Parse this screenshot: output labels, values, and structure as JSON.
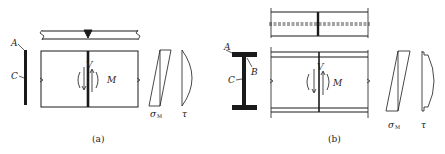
{
  "figure": {
    "panels": [
      {
        "id": "a",
        "caption": "(a)",
        "section_labels": {
          "top": "A",
          "middle": "C"
        },
        "internal_forces": {
          "shear": "V",
          "moment": "M"
        },
        "stress_diagrams": {
          "normal": "σ",
          "normal_sub": "M",
          "shear": "τ"
        },
        "description": "Plate (rectangular section) with butt weld; weld line under shear V and moment M"
      },
      {
        "id": "b",
        "caption": "(b)",
        "section_labels": {
          "top": "A",
          "flange_web": "B",
          "middle": "C"
        },
        "internal_forces": {
          "shear": "V",
          "moment": "M"
        },
        "stress_diagrams": {
          "normal": "σ",
          "normal_sub": "M",
          "shear": "τ"
        },
        "description": "I-section beam with butt weld across flanges and web under shear V and moment M"
      }
    ],
    "colors": {
      "ink": "#1a1a1a",
      "background": "#ffffff"
    }
  }
}
